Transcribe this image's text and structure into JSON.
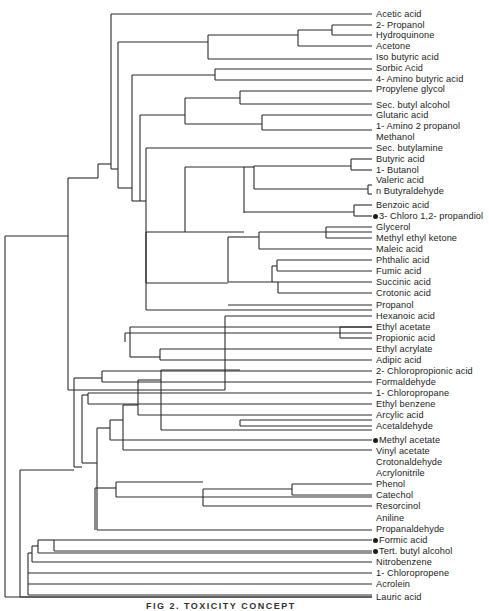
{
  "figure": {
    "caption": "FIG 2.  TOXICITY CONCEPT",
    "colors": {
      "line": "#2a2a2a",
      "text": "#1c1c1c",
      "background": "#ffffff"
    }
  },
  "leaves": [
    {
      "label": "Acetic acid",
      "y": 14
    },
    {
      "label": "2- Propanol",
      "y": 25
    },
    {
      "label": "Hydroquinone",
      "y": 35
    },
    {
      "label": "Acetone",
      "y": 46
    },
    {
      "label": "Iso butyric acid",
      "y": 57
    },
    {
      "label": "Sorbic Acid",
      "y": 68
    },
    {
      "label": "4- Amino butyric acid",
      "y": 79
    },
    {
      "label": "Propylene glycol",
      "y": 89
    },
    {
      "label": "Sec. butyl alcohol",
      "y": 105
    },
    {
      "label": "Glutaric acid",
      "y": 115
    },
    {
      "label": "1- Amino 2 propanol",
      "y": 126
    },
    {
      "label": "Methanol",
      "y": 137
    },
    {
      "label": "Sec. butylamine",
      "y": 148
    },
    {
      "label": "Butyric acid",
      "y": 159
    },
    {
      "label": "1- Butanol",
      "y": 170
    },
    {
      "label": "Valeric acid",
      "y": 180
    },
    {
      "label": "n Butyraldehyde",
      "y": 191
    },
    {
      "label": "Benzoic acid",
      "y": 205
    },
    {
      "label": "3- Chloro 1,2- propandiol",
      "y": 216,
      "marker": true
    },
    {
      "label": "Glycerol",
      "y": 227
    },
    {
      "label": "Methyl ethyl ketone",
      "y": 238
    },
    {
      "label": "Maleic acid",
      "y": 249
    },
    {
      "label": "Phthalic acid",
      "y": 260
    },
    {
      "label": "Fumic acid",
      "y": 271
    },
    {
      "label": "Succinic acid",
      "y": 282
    },
    {
      "label": "Crotonic acid",
      "y": 293
    },
    {
      "label": "Propanol",
      "y": 305
    },
    {
      "label": "Hexanoic acid",
      "y": 316
    },
    {
      "label": "Ethyl acetate",
      "y": 327
    },
    {
      "label": "Propionic acid",
      "y": 338
    },
    {
      "label": "Ethyl acrylate",
      "y": 349
    },
    {
      "label": "Adipic acid",
      "y": 360
    },
    {
      "label": "2- Chloropropionic acid",
      "y": 371
    },
    {
      "label": "Formaldehyde",
      "y": 382
    },
    {
      "label": "1- Chloropropane",
      "y": 393
    },
    {
      "label": "Ethyl benzene",
      "y": 404
    },
    {
      "label": "Arcylic acid",
      "y": 415
    },
    {
      "label": "Acetaldehyde",
      "y": 426
    },
    {
      "label": "Methyl acetate",
      "y": 440,
      "marker": true
    },
    {
      "label": "Vinyl acetate",
      "y": 451
    },
    {
      "label": "Crotonaldehyde",
      "y": 462
    },
    {
      "label": "Acrylonitrile",
      "y": 473
    },
    {
      "label": "Phenol",
      "y": 484
    },
    {
      "label": "Catechol",
      "y": 495
    },
    {
      "label": "Resorcinol",
      "y": 506
    },
    {
      "label": "Aniline",
      "y": 518
    },
    {
      "label": "Propanaldehyde",
      "y": 529
    },
    {
      "label": "Formic acid",
      "y": 540,
      "marker": true
    },
    {
      "label": "Tert.  butyl alcohol",
      "y": 551,
      "marker": true
    },
    {
      "label": "Nitrobenzene",
      "y": 562
    },
    {
      "label": "1- Chloropropene",
      "y": 573
    },
    {
      "label": "Acrolein",
      "y": 584
    },
    {
      "label": "Lauric acid",
      "y": 597
    }
  ],
  "segments": [
    [
      5,
      236,
      5,
      597
    ],
    [
      5,
      236,
      68,
      236
    ],
    [
      5,
      597,
      372,
      597
    ],
    [
      68,
      178,
      68,
      390
    ],
    [
      68,
      178,
      98,
      178
    ],
    [
      68,
      390,
      225,
      390
    ],
    [
      98,
      164,
      98,
      178
    ],
    [
      98,
      164,
      111,
      164
    ],
    [
      111,
      14,
      111,
      169
    ],
    [
      111,
      14,
      372,
      14
    ],
    [
      111,
      169,
      118,
      169
    ],
    [
      118,
      42,
      118,
      188
    ],
    [
      118,
      42,
      208,
      42
    ],
    [
      118,
      188,
      132,
      188
    ],
    [
      208,
      35,
      208,
      59
    ],
    [
      208,
      35,
      298,
      35
    ],
    [
      208,
      59,
      372,
      59
    ],
    [
      298,
      30,
      298,
      46
    ],
    [
      298,
      30,
      332,
      30
    ],
    [
      298,
      46,
      372,
      46
    ],
    [
      332,
      25,
      332,
      35
    ],
    [
      332,
      25,
      372,
      25
    ],
    [
      332,
      35,
      372,
      35
    ],
    [
      132,
      75,
      132,
      201
    ],
    [
      132,
      75,
      215,
      75
    ],
    [
      132,
      201,
      140,
      201
    ],
    [
      215,
      69,
      215,
      80
    ],
    [
      215,
      69,
      372,
      69
    ],
    [
      215,
      80,
      372,
      80
    ],
    [
      140,
      115,
      140,
      201
    ],
    [
      140,
      115,
      185,
      115
    ],
    [
      140,
      201,
      146,
      201
    ],
    [
      185,
      98,
      185,
      124
    ],
    [
      185,
      98,
      240,
      98
    ],
    [
      185,
      124,
      262,
      124
    ],
    [
      240,
      91,
      240,
      104
    ],
    [
      240,
      91,
      372,
      91
    ],
    [
      240,
      104,
      372,
      104
    ],
    [
      262,
      115,
      262,
      130
    ],
    [
      262,
      115,
      372,
      115
    ],
    [
      262,
      130,
      372,
      130
    ],
    [
      146,
      148,
      146,
      310
    ],
    [
      146,
      148,
      372,
      148
    ],
    [
      146,
      310,
      372,
      310
    ],
    [
      146,
      232,
      146,
      283
    ],
    [
      146,
      232,
      185,
      232
    ],
    [
      146,
      283,
      228,
      283
    ],
    [
      185,
      167,
      185,
      232
    ],
    [
      185,
      167,
      244,
      167
    ],
    [
      185,
      232,
      244,
      232
    ],
    [
      244,
      167,
      244,
      212
    ],
    [
      244,
      167,
      254,
      167
    ],
    [
      244,
      212,
      354,
      212
    ],
    [
      254,
      166,
      254,
      189
    ],
    [
      254,
      166,
      351,
      166
    ],
    [
      254,
      189,
      368,
      189
    ],
    [
      351,
      159,
      351,
      170
    ],
    [
      351,
      159,
      372,
      159
    ],
    [
      351,
      170,
      372,
      170
    ],
    [
      368,
      185,
      368,
      194
    ],
    [
      368,
      185,
      372,
      185
    ],
    [
      368,
      194,
      372,
      194
    ],
    [
      354,
      205,
      354,
      216
    ],
    [
      354,
      205,
      372,
      205
    ],
    [
      354,
      216,
      372,
      216
    ],
    [
      244,
      212,
      244,
      213
    ],
    [
      228,
      237,
      228,
      282
    ],
    [
      228,
      237,
      259,
      237
    ],
    [
      228,
      282,
      272,
      282
    ],
    [
      259,
      232,
      259,
      249
    ],
    [
      259,
      232,
      372,
      232
    ],
    [
      259,
      249,
      372,
      249
    ],
    [
      326,
      227,
      326,
      238
    ],
    [
      326,
      227,
      372,
      227
    ],
    [
      326,
      238,
      372,
      238
    ],
    [
      272,
      266,
      272,
      282
    ],
    [
      272,
      266,
      277,
      266
    ],
    [
      272,
      282,
      278,
      282
    ],
    [
      277,
      260,
      277,
      271
    ],
    [
      277,
      260,
      372,
      260
    ],
    [
      277,
      271,
      372,
      271
    ],
    [
      278,
      282,
      278,
      293
    ],
    [
      278,
      282,
      372,
      282
    ],
    [
      278,
      293,
      372,
      293
    ],
    [
      228,
      305,
      228,
      305
    ],
    [
      228,
      305,
      372,
      305
    ],
    [
      225,
      316,
      225,
      390
    ],
    [
      225,
      316,
      372,
      316
    ],
    [
      130,
      327,
      130,
      357
    ],
    [
      130,
      327,
      372,
      327
    ],
    [
      125,
      333,
      125,
      342
    ],
    [
      125,
      333,
      372,
      333
    ],
    [
      340,
      327,
      340,
      338
    ],
    [
      340,
      327,
      372,
      327
    ],
    [
      340,
      338,
      372,
      338
    ],
    [
      130,
      357,
      160,
      357
    ],
    [
      160,
      349,
      160,
      360
    ],
    [
      160,
      349,
      372,
      349
    ],
    [
      160,
      360,
      372,
      360
    ],
    [
      20,
      470,
      20,
      597
    ],
    [
      20,
      470,
      74,
      470
    ],
    [
      20,
      597,
      372,
      597
    ],
    [
      74,
      378,
      74,
      467
    ],
    [
      74,
      378,
      102,
      378
    ],
    [
      74,
      467,
      82,
      467
    ],
    [
      102,
      371,
      102,
      382
    ],
    [
      102,
      371,
      372,
      371
    ],
    [
      102,
      382,
      372,
      382
    ],
    [
      82,
      395,
      82,
      463
    ],
    [
      82,
      395,
      88,
      395
    ],
    [
      82,
      463,
      97,
      463
    ],
    [
      88,
      393,
      88,
      404
    ],
    [
      88,
      393,
      372,
      393
    ],
    [
      88,
      404,
      372,
      404
    ],
    [
      97,
      428,
      97,
      530
    ],
    [
      97,
      428,
      110,
      428
    ],
    [
      97,
      530,
      372,
      530
    ],
    [
      110,
      420,
      110,
      440
    ],
    [
      110,
      420,
      123,
      420
    ],
    [
      110,
      440,
      372,
      440
    ],
    [
      123,
      405,
      123,
      450
    ],
    [
      123,
      405,
      138,
      405
    ],
    [
      123,
      450,
      372,
      450
    ],
    [
      138,
      380,
      138,
      415
    ],
    [
      138,
      380,
      161,
      380
    ],
    [
      138,
      415,
      372,
      415
    ],
    [
      161,
      370,
      161,
      430
    ],
    [
      161,
      370,
      240,
      370
    ],
    [
      161,
      430,
      372,
      430
    ],
    [
      240,
      420,
      240,
      426
    ],
    [
      240,
      420,
      372,
      420
    ],
    [
      240,
      426,
      372,
      426
    ],
    [
      95,
      488,
      95,
      530
    ],
    [
      95,
      488,
      116,
      488
    ],
    [
      116,
      482,
      116,
      497
    ],
    [
      116,
      482,
      203,
      482
    ],
    [
      116,
      497,
      372,
      497
    ],
    [
      203,
      489,
      203,
      506
    ],
    [
      203,
      489,
      292,
      489
    ],
    [
      203,
      506,
      372,
      506
    ],
    [
      292,
      484,
      292,
      495
    ],
    [
      292,
      484,
      372,
      484
    ],
    [
      292,
      495,
      372,
      495
    ],
    [
      20,
      597,
      20,
      597
    ],
    [
      28,
      553,
      28,
      595
    ],
    [
      28,
      553,
      32,
      553
    ],
    [
      28,
      595,
      372,
      595
    ],
    [
      32,
      546,
      32,
      562
    ],
    [
      32,
      546,
      38,
      546
    ],
    [
      32,
      562,
      372,
      562
    ],
    [
      38,
      540,
      38,
      553
    ],
    [
      38,
      540,
      54,
      540
    ],
    [
      38,
      553,
      372,
      553
    ],
    [
      54,
      540,
      54,
      551
    ],
    [
      54,
      540,
      372,
      540
    ],
    [
      54,
      551,
      372,
      551
    ],
    [
      28,
      573,
      372,
      573
    ],
    [
      28,
      584,
      372,
      584
    ]
  ]
}
